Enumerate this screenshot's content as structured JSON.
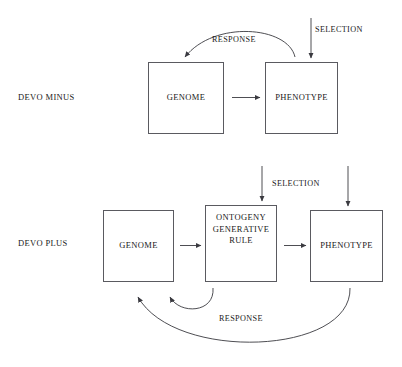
{
  "figure": {
    "title_cut_top": "",
    "caption_cut_bottom": ""
  },
  "rows": [
    {
      "id": "devo-minus",
      "label": "DEVO MINUS",
      "boxes": [
        {
          "id": "genome-minus",
          "label": "GENOME"
        },
        {
          "id": "phenotype-minus",
          "label": "PHENOTYPE"
        }
      ],
      "edge_labels": [
        {
          "id": "response-minus",
          "label": "RESPONSE"
        },
        {
          "id": "selection-minus",
          "label": "SELECTION"
        }
      ]
    },
    {
      "id": "devo-plus",
      "label": "DEVO PLUS",
      "boxes": [
        {
          "id": "genome-plus",
          "label": "GENOME"
        },
        {
          "id": "ontogeny-plus",
          "label_line1": "ONTOGENY",
          "label_line2": "GENERATIVE",
          "label_line3": "RULE"
        },
        {
          "id": "phenotype-plus",
          "label": "PHENOTYPE"
        }
      ],
      "edge_labels": [
        {
          "id": "selection-plus",
          "label": "SELECTION"
        },
        {
          "id": "response-plus",
          "label": "RESPONSE"
        }
      ]
    }
  ],
  "colors": {
    "background": "#ffffff",
    "stroke": "#5a5a60",
    "text": "#1a1a1a"
  }
}
